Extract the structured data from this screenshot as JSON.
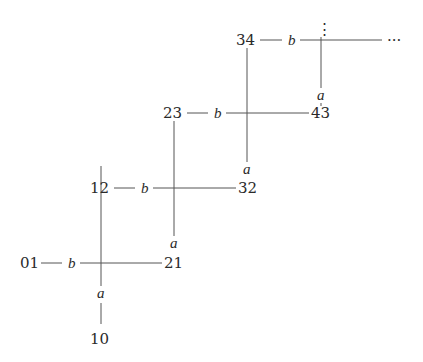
{
  "diagram": {
    "type": "staircase-graph",
    "nodes": [
      {
        "id": "01",
        "label": "01",
        "x": 30,
        "y": 263
      },
      {
        "id": "10",
        "label": "10",
        "x": 101,
        "y": 341
      },
      {
        "id": "21",
        "label": "21",
        "x": 175,
        "y": 263
      },
      {
        "id": "12",
        "label": "12",
        "x": 101,
        "y": 188
      },
      {
        "id": "32",
        "label": "32",
        "x": 248,
        "y": 188
      },
      {
        "id": "23",
        "label": "23",
        "x": 174,
        "y": 113
      },
      {
        "id": "43",
        "label": "43",
        "x": 321,
        "y": 113
      },
      {
        "id": "34",
        "label": "34",
        "x": 247,
        "y": 40
      }
    ],
    "edge_labels": {
      "b": "b",
      "a": "a"
    },
    "continuation": {
      "vertical": "⋮",
      "horizontal": "···"
    },
    "b_edges": [
      {
        "from": "01",
        "label": "b",
        "to": "21"
      },
      {
        "from": "12",
        "label": "b",
        "to": "32"
      },
      {
        "from": "23",
        "label": "b",
        "to": "43"
      },
      {
        "from": "34",
        "label": "b",
        "to": "···"
      }
    ],
    "a_edges": [
      {
        "from": "12",
        "label": "a",
        "to": "10"
      },
      {
        "from": "23",
        "label": "a",
        "to": "21"
      },
      {
        "from": "34",
        "label": "a",
        "to": "32"
      },
      {
        "from": "⋮",
        "label": "a",
        "to": "43"
      }
    ]
  }
}
